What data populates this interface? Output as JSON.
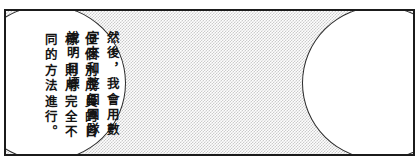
{
  "panel": {
    "kind": "manga-comic-panel",
    "width": 419,
    "height": 167,
    "border_color": "#1b1b1b",
    "background_pattern": "halftone-screentone-dots",
    "background_tone_color": "#c9c9c9",
    "page_background": "#ffffff"
  },
  "balloons": [
    {
      "id": "balloon-left",
      "shape": "ellipse",
      "fill": "#ffffff",
      "outline_color": "#2b2b2b",
      "clipped_edge": "left",
      "writing_mode": "vertical-rl",
      "full_text": "但個別成員的目標，則用完全不同的方法進行。",
      "columns": [
        "但個別成員的目",
        "標，則用完全不",
        "同的方法進行。"
      ]
    },
    {
      "id": "balloon-right",
      "shape": "ellipse",
      "fill": "#ffffff",
      "outline_color": "#2b2b2b",
      "clipped_edge": "right",
      "writing_mode": "vertical-rl",
      "full_text": "然後，我會用數字來和整個團隊說明目標",
      "columns": [
        "然後，我會用數",
        "字來和整個團隊",
        "說明目標"
      ]
    }
  ]
}
